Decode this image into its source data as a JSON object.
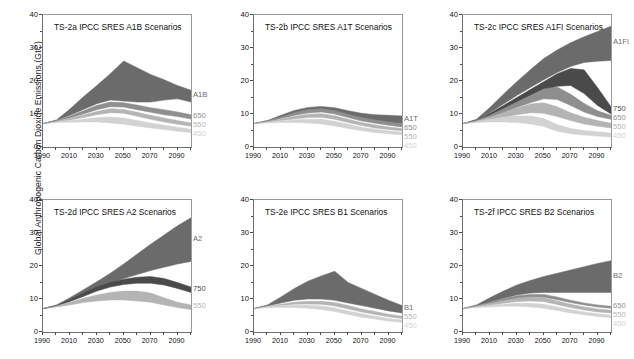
{
  "figure": {
    "ylabel": "Global Anthropogenic Carbon Dioxide Emissions (GtC)",
    "xticks": [
      "1990",
      "2010",
      "2030",
      "2050",
      "2070",
      "2090"
    ],
    "yticks": [
      "0",
      "10",
      "20",
      "30",
      "40"
    ]
  },
  "colors": {
    "ref_band": "#6b6b6b",
    "s750": "#4a4a4a",
    "s650": "#8e8e8e",
    "s550": "#b4b4b4",
    "s450": "#d2d2d2",
    "axis": "#5a5a5a",
    "text": "#111111",
    "label_ref": "#6b6b6b",
    "label_750": "#4a4a4a",
    "label_650": "#8e8e8e",
    "label_550": "#b4b4b4",
    "label_450": "#d2d2d2"
  },
  "chart_data": {
    "type": "area",
    "xlabel": "",
    "ylabel": "Global Anthropogenic Carbon Dioxide Emissions (GtC)",
    "xlim": [
      1990,
      2100
    ],
    "ylim": [
      0,
      40
    ],
    "xticks": [
      1990,
      2010,
      2030,
      2050,
      2070,
      2090
    ],
    "yticks": [
      0,
      10,
      20,
      30,
      40
    ],
    "grid": false,
    "legend": "right-edge-inline-labels",
    "x": [
      1990,
      2000,
      2010,
      2020,
      2030,
      2040,
      2050,
      2060,
      2070,
      2080,
      2090,
      2100
    ],
    "panels": [
      {
        "id": "TS-2a",
        "title": "TS-2a IPCC SRES A1B Scenarios",
        "reference_label": "A1B",
        "series": [
          {
            "name": "A1B",
            "role": "reference-range",
            "color": "#6b6b6b",
            "upper": [
              7.1,
              8.2,
              11.5,
              15.2,
              18.6,
              22.2,
              26.1,
              24.0,
              22.0,
              20.4,
              18.6,
              17.2
            ],
            "lower": [
              7.1,
              8.0,
              9.6,
              11.4,
              13.1,
              14.2,
              13.9,
              13.6,
              13.6,
              14.2,
              14.6,
              13.6
            ]
          },
          {
            "name": "650",
            "role": "stabilisation",
            "color": "#8e8e8e",
            "upper": [
              7.1,
              8.0,
              9.4,
              11.0,
              12.6,
              13.6,
              13.4,
              12.7,
              11.9,
              11.3,
              10.6,
              9.8
            ],
            "lower": [
              7.1,
              7.8,
              8.8,
              10.0,
              11.3,
              12.2,
              12.1,
              11.3,
              10.5,
              9.8,
              9.2,
              8.5
            ]
          },
          {
            "name": "550",
            "role": "stabilisation",
            "color": "#b4b4b4",
            "upper": [
              7.1,
              7.8,
              8.7,
              9.7,
              10.8,
              11.6,
              11.4,
              10.5,
              9.6,
              8.8,
              8.0,
              7.3
            ],
            "lower": [
              7.1,
              7.6,
              8.2,
              8.9,
              9.8,
              10.4,
              10.2,
              9.3,
              8.4,
              7.6,
              6.9,
              6.3
            ]
          },
          {
            "name": "450",
            "role": "stabilisation",
            "color": "#d2d2d2",
            "upper": [
              7.1,
              7.6,
              8.0,
              8.4,
              8.9,
              9.1,
              8.8,
              8.0,
              7.3,
              6.6,
              6.0,
              5.4
            ],
            "lower": [
              7.1,
              7.4,
              7.5,
              7.6,
              7.6,
              7.3,
              6.9,
              6.3,
              5.8,
              5.3,
              4.8,
              4.4
            ]
          }
        ]
      },
      {
        "id": "TS-2b",
        "title": "TS-2b IPCC SRES A1T Scenarios",
        "reference_label": "A1T",
        "series": [
          {
            "name": "A1T",
            "role": "reference-range",
            "color": "#6b6b6b",
            "upper": [
              7.1,
              8.0,
              9.6,
              11.1,
              12.0,
              12.3,
              11.9,
              11.0,
              10.2,
              9.8,
              9.6,
              9.4
            ],
            "lower": [
              7.1,
              7.8,
              8.8,
              9.8,
              10.6,
              11.1,
              10.5,
              9.4,
              8.4,
              7.8,
              7.4,
              7.1
            ]
          },
          {
            "name": "650",
            "role": "stabilisation",
            "color": "#8e8e8e",
            "upper": [
              7.1,
              7.9,
              9.1,
              10.4,
              11.3,
              11.6,
              11.0,
              9.9,
              8.9,
              8.2,
              7.6,
              7.0
            ],
            "lower": [
              7.1,
              7.7,
              8.6,
              9.6,
              10.3,
              10.6,
              10.0,
              8.9,
              7.9,
              7.2,
              6.6,
              6.1
            ]
          },
          {
            "name": "550",
            "role": "stabilisation",
            "color": "#b4b4b4",
            "upper": [
              7.1,
              7.7,
              8.5,
              9.3,
              9.9,
              10.1,
              9.5,
              8.4,
              7.4,
              6.7,
              6.1,
              5.6
            ],
            "lower": [
              7.1,
              7.5,
              8.0,
              8.5,
              8.9,
              9.0,
              8.4,
              7.4,
              6.5,
              5.8,
              5.3,
              4.9
            ]
          },
          {
            "name": "450",
            "role": "stabilisation",
            "color": "#d2d2d2",
            "upper": [
              7.1,
              7.5,
              7.9,
              8.2,
              8.4,
              8.4,
              7.8,
              6.9,
              6.0,
              5.4,
              4.9,
              4.5
            ],
            "lower": [
              7.1,
              7.3,
              7.4,
              7.4,
              7.3,
              7.0,
              6.4,
              5.6,
              4.9,
              4.4,
              4.0,
              3.7
            ]
          }
        ]
      },
      {
        "id": "TS-2c",
        "title": "TS-2c IPCC SRES A1FI Scenarios",
        "reference_label": "A1FI",
        "series": [
          {
            "name": "A1FI",
            "role": "reference-range",
            "color": "#6b6b6b",
            "upper": [
              7.1,
              8.4,
              12.0,
              16.0,
              19.8,
              23.4,
              26.8,
              29.4,
              31.6,
              33.4,
              35.0,
              36.6
            ],
            "lower": [
              7.1,
              8.1,
              10.4,
              13.0,
              15.6,
              18.0,
              20.4,
              22.6,
              24.4,
              25.6,
              26.0,
              26.2
            ]
          },
          {
            "name": "750",
            "role": "stabilisation",
            "color": "#4a4a4a",
            "upper": [
              7.1,
              8.1,
              10.2,
              12.6,
              15.0,
              17.4,
              19.8,
              22.2,
              23.8,
              23.4,
              18.0,
              12.2
            ],
            "lower": [
              7.1,
              7.9,
              9.4,
              11.2,
              13.2,
              15.2,
              17.0,
              18.4,
              18.6,
              16.2,
              12.6,
              10.0
            ]
          },
          {
            "name": "650",
            "role": "stabilisation",
            "color": "#8e8e8e",
            "upper": [
              7.1,
              8.0,
              9.6,
              11.6,
              13.6,
              15.6,
              17.6,
              18.2,
              16.0,
              13.2,
              11.0,
              9.6
            ],
            "lower": [
              7.1,
              7.8,
              9.0,
              10.4,
              12.0,
              13.4,
              14.6,
              14.4,
              12.6,
              10.6,
              9.2,
              8.4
            ]
          },
          {
            "name": "550",
            "role": "stabilisation",
            "color": "#b4b4b4",
            "upper": [
              7.1,
              7.9,
              9.0,
              10.4,
              11.8,
              13.0,
              13.4,
              12.2,
              10.4,
              9.0,
              8.0,
              7.2
            ],
            "lower": [
              7.1,
              7.6,
              8.2,
              9.0,
              9.8,
              10.4,
              10.2,
              9.2,
              8.0,
              7.0,
              6.3,
              5.8
            ]
          },
          {
            "name": "450",
            "role": "stabilisation",
            "color": "#d2d2d2",
            "upper": [
              7.1,
              7.7,
              8.4,
              9.0,
              9.4,
              9.4,
              8.6,
              6.8,
              5.6,
              5.0,
              4.6,
              4.2
            ],
            "lower": [
              7.1,
              7.4,
              7.6,
              7.6,
              7.4,
              7.0,
              6.2,
              4.8,
              4.0,
              3.6,
              3.3,
              3.0
            ]
          }
        ]
      },
      {
        "id": "TS-2d",
        "title": "TS-2d IPCC SRES A2 Scenarios",
        "reference_label": "A2",
        "series": [
          {
            "name": "A2",
            "role": "reference-range",
            "color": "#6b6b6b",
            "upper": [
              7.1,
              8.2,
              10.4,
              12.8,
              15.2,
              17.8,
              20.6,
              23.6,
              26.6,
              29.4,
              32.2,
              34.6
            ],
            "lower": [
              7.1,
              8.0,
              9.6,
              11.4,
              13.2,
              14.8,
              16.2,
              17.4,
              18.6,
              19.6,
              20.6,
              21.4
            ]
          },
          {
            "name": "750",
            "role": "stabilisation",
            "color": "#4a4a4a",
            "upper": [
              7.1,
              8.0,
              9.8,
              11.8,
              13.6,
              15.0,
              16.0,
              16.6,
              16.8,
              16.2,
              15.0,
              13.6
            ],
            "lower": [
              7.1,
              7.8,
              9.2,
              10.8,
              12.4,
              13.6,
              14.4,
              14.8,
              14.8,
              14.2,
              13.2,
              12.0
            ]
          },
          {
            "name": "550",
            "role": "stabilisation",
            "color": "#b4b4b4",
            "upper": [
              7.1,
              7.9,
              9.0,
              10.2,
              11.2,
              12.0,
              12.4,
              12.4,
              11.8,
              10.4,
              9.0,
              8.2
            ],
            "lower": [
              7.1,
              7.6,
              8.2,
              8.9,
              9.4,
              9.7,
              9.7,
              9.4,
              9.0,
              8.2,
              7.4,
              6.8
            ]
          }
        ]
      },
      {
        "id": "TS-2e",
        "title": "TS-2e IPCC SRES B1 Scenarios",
        "reference_label": "B1",
        "series": [
          {
            "name": "B1",
            "role": "reference-range",
            "color": "#6b6b6b",
            "upper": [
              7.1,
              8.2,
              10.6,
              13.2,
              15.4,
              17.0,
              18.4,
              15.0,
              13.2,
              11.4,
              9.6,
              8.0
            ],
            "lower": [
              7.1,
              7.9,
              8.8,
              9.6,
              10.0,
              10.0,
              9.6,
              8.8,
              8.0,
              7.2,
              6.4,
              5.8
            ]
          },
          {
            "name": "550",
            "role": "stabilisation",
            "color": "#b4b4b4",
            "upper": [
              7.1,
              7.8,
              8.4,
              9.0,
              9.3,
              9.3,
              8.9,
              8.0,
              7.0,
              6.2,
              5.4,
              4.8
            ],
            "lower": [
              7.1,
              7.6,
              8.0,
              8.4,
              8.5,
              8.4,
              7.9,
              7.0,
              6.1,
              5.3,
              4.6,
              4.1
            ]
          },
          {
            "name": "450",
            "role": "stabilisation",
            "color": "#d2d2d2",
            "upper": [
              7.1,
              7.6,
              7.9,
              8.1,
              8.1,
              7.9,
              7.3,
              6.4,
              5.5,
              4.8,
              4.1,
              3.6
            ],
            "lower": [
              7.1,
              7.4,
              7.4,
              7.4,
              7.2,
              6.8,
              6.2,
              5.3,
              4.5,
              3.9,
              3.3,
              2.9
            ]
          }
        ]
      },
      {
        "id": "TS-2f",
        "title": "TS-2f IPCC SRES B2 Scenarios",
        "reference_label": "B2",
        "series": [
          {
            "name": "B2",
            "role": "reference-range",
            "color": "#6b6b6b",
            "upper": [
              7.1,
              8.2,
              10.4,
              12.4,
              14.2,
              15.6,
              16.8,
              17.8,
              18.8,
              19.8,
              20.8,
              21.6
            ],
            "lower": [
              7.1,
              7.9,
              9.0,
              10.2,
              11.2,
              11.8,
              12.0,
              12.0,
              12.0,
              12.0,
              12.0,
              12.0
            ]
          },
          {
            "name": "650",
            "role": "stabilisation",
            "color": "#8e8e8e",
            "upper": [
              7.1,
              7.9,
              9.0,
              10.2,
              11.0,
              11.4,
              11.4,
              10.6,
              9.6,
              8.8,
              8.2,
              7.8
            ],
            "lower": [
              7.1,
              7.7,
              8.5,
              9.4,
              10.1,
              10.5,
              10.5,
              9.8,
              8.9,
              8.2,
              7.6,
              7.2
            ]
          },
          {
            "name": "550",
            "role": "stabilisation",
            "color": "#b4b4b4",
            "upper": [
              7.1,
              7.8,
              8.6,
              9.5,
              10.2,
              10.6,
              10.4,
              9.4,
              8.4,
              7.6,
              7.0,
              6.6
            ],
            "lower": [
              7.1,
              7.6,
              8.1,
              8.7,
              9.2,
              9.4,
              9.2,
              8.3,
              7.4,
              6.7,
              6.1,
              5.8
            ]
          },
          {
            "name": "450",
            "role": "stabilisation",
            "color": "#d2d2d2",
            "upper": [
              7.1,
              7.6,
              8.0,
              8.4,
              8.7,
              8.7,
              8.4,
              7.6,
              6.8,
              6.1,
              5.5,
              5.1
            ],
            "lower": [
              7.1,
              7.4,
              7.6,
              7.8,
              7.8,
              7.6,
              7.2,
              6.5,
              5.8,
              5.2,
              4.7,
              4.4
            ]
          }
        ]
      }
    ]
  }
}
